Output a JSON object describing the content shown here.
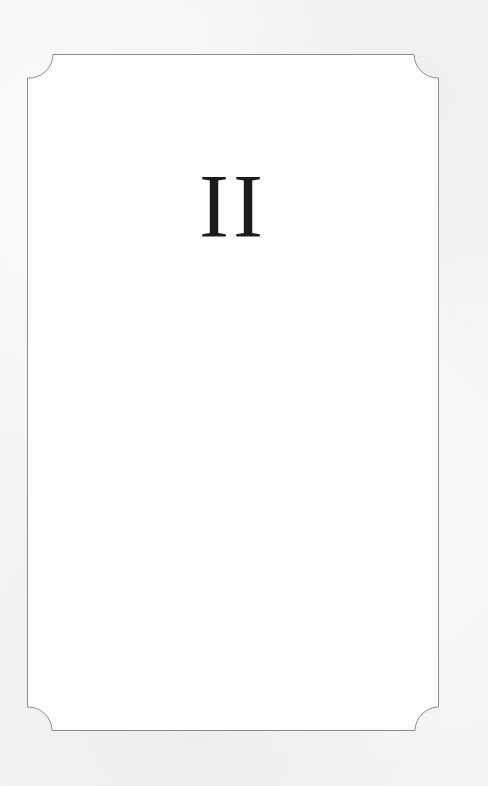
{
  "page": {
    "chapter_numeral": "II",
    "colors": {
      "background": "#f4f4f3",
      "frame_stroke": "#8c8c8c",
      "text": "#1b1b1b"
    }
  }
}
